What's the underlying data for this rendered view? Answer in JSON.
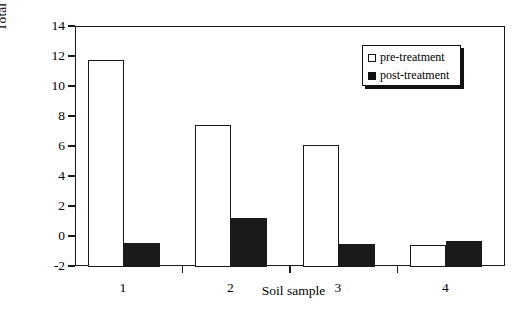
{
  "chart_data": {
    "type": "bar",
    "title": "",
    "xlabel": "Soil sample",
    "ylabel": "Total swell percentage, %",
    "categories": [
      "1",
      "2",
      "3",
      "4"
    ],
    "series": [
      {
        "name": "pre-treatment",
        "style": "open",
        "values": [
          11.8,
          7.5,
          6.15,
          -0.5
        ]
      },
      {
        "name": "post-treatment",
        "style": "filled",
        "values": [
          -0.4,
          1.25,
          -0.45,
          -0.25
        ]
      }
    ],
    "ylim": [
      -2,
      14
    ],
    "yticks": [
      -2,
      0,
      2,
      4,
      6,
      8,
      10,
      12,
      14
    ],
    "ytick_labels": [
      "-2",
      "0",
      "2",
      "4",
      "6",
      "8",
      "10",
      "12",
      "14"
    ],
    "baseline": -2,
    "grid": false,
    "legend_position": "top-right",
    "colors": {
      "open_fill": "#ffffff",
      "filled_fill": "#1a1a1a",
      "axis": "#1a1a1a"
    }
  },
  "legend": {
    "entries": [
      {
        "label": "pre-treatment",
        "marker": "open-square-icon"
      },
      {
        "label": "post-treatment",
        "marker": "filled-square-icon"
      }
    ]
  }
}
